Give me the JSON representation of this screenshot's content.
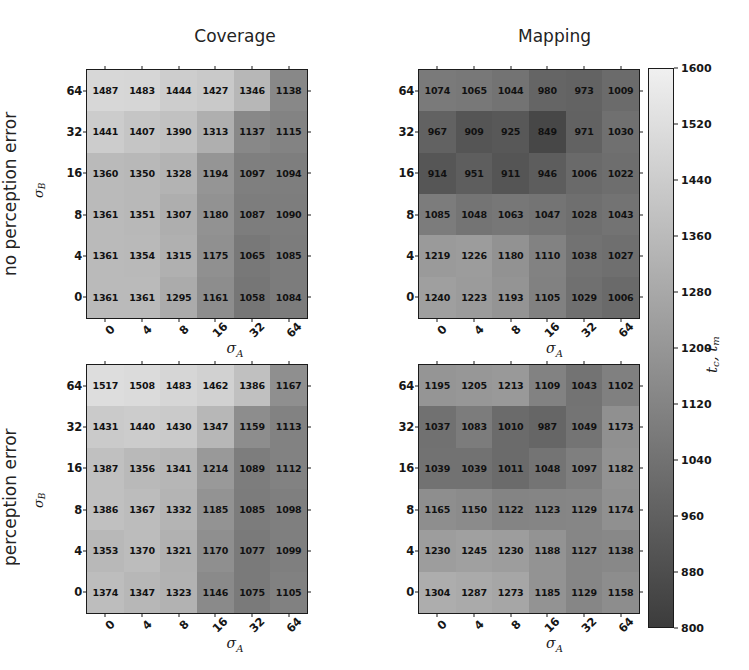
{
  "figure": {
    "column_titles": [
      "Coverage",
      "Mapping"
    ],
    "row_labels": [
      "no perception error",
      "perception error"
    ],
    "xlabel": "σ",
    "xlabel_sub": "A",
    "ylabel": "σ",
    "ylabel_sub": "B",
    "x_ticks": [
      "0",
      "4",
      "8",
      "16",
      "32",
      "64"
    ],
    "y_ticks": [
      "64",
      "32",
      "16",
      "8",
      "4",
      "0"
    ]
  },
  "colorbar": {
    "label": "t",
    "label_sub": "c",
    "label2": ", t",
    "label2_sub": "m",
    "label_full": "t_c, t_m",
    "vmin": 800,
    "vmax": 1600,
    "ticks": [
      "1600",
      "1520",
      "1440",
      "1360",
      "1280",
      "1200",
      "1120",
      "1040",
      "960",
      "880",
      "800"
    ],
    "tick_values": [
      1600,
      1520,
      1440,
      1360,
      1280,
      1200,
      1120,
      1040,
      960,
      880,
      800
    ],
    "colormap": "gray",
    "low_color": "#4a4a4a",
    "high_color": "#efefef"
  },
  "chart_data": {
    "type": "heatmap",
    "xlabel": "sigma_A",
    "ylabel": "sigma_B",
    "x_categories": [
      "0",
      "4",
      "8",
      "16",
      "32",
      "64"
    ],
    "y_categories": [
      "64",
      "32",
      "16",
      "8",
      "4",
      "0"
    ],
    "vmin": 800,
    "vmax": 1600,
    "colorbar_label": "t_c, t_m",
    "panels": [
      {
        "id": "coverage-no-perception-error",
        "column": "Coverage",
        "row": "no perception error",
        "values": [
          [
            1487,
            1483,
            1444,
            1427,
            1346,
            1138
          ],
          [
            1441,
            1407,
            1390,
            1313,
            1137,
            1115
          ],
          [
            1360,
            1350,
            1328,
            1194,
            1097,
            1094
          ],
          [
            1361,
            1351,
            1307,
            1180,
            1087,
            1090
          ],
          [
            1361,
            1354,
            1315,
            1175,
            1065,
            1085
          ],
          [
            1361,
            1361,
            1295,
            1161,
            1058,
            1084
          ]
        ]
      },
      {
        "id": "mapping-no-perception-error",
        "column": "Mapping",
        "row": "no perception error",
        "values": [
          [
            1074,
            1065,
            1044,
            980,
            973,
            1009
          ],
          [
            967,
            909,
            925,
            849,
            971,
            1030
          ],
          [
            914,
            951,
            911,
            946,
            1006,
            1022
          ],
          [
            1085,
            1048,
            1063,
            1047,
            1028,
            1043
          ],
          [
            1219,
            1226,
            1180,
            1110,
            1038,
            1027
          ],
          [
            1240,
            1223,
            1193,
            1105,
            1029,
            1006
          ]
        ]
      },
      {
        "id": "coverage-perception-error",
        "column": "Coverage",
        "row": "perception error",
        "values": [
          [
            1517,
            1508,
            1483,
            1462,
            1386,
            1167
          ],
          [
            1431,
            1440,
            1430,
            1347,
            1159,
            1113
          ],
          [
            1387,
            1356,
            1341,
            1214,
            1089,
            1112
          ],
          [
            1386,
            1367,
            1332,
            1185,
            1085,
            1098
          ],
          [
            1353,
            1370,
            1321,
            1170,
            1077,
            1099
          ],
          [
            1374,
            1347,
            1323,
            1146,
            1075,
            1105
          ]
        ]
      },
      {
        "id": "mapping-perception-error",
        "column": "Mapping",
        "row": "perception error",
        "values": [
          [
            1195,
            1205,
            1213,
            1109,
            1043,
            1102
          ],
          [
            1037,
            1083,
            1010,
            987,
            1049,
            1173
          ],
          [
            1039,
            1039,
            1011,
            1048,
            1097,
            1182
          ],
          [
            1165,
            1150,
            1122,
            1123,
            1129,
            1174
          ],
          [
            1230,
            1245,
            1230,
            1188,
            1127,
            1138
          ],
          [
            1304,
            1287,
            1273,
            1185,
            1129,
            1158
          ]
        ]
      }
    ]
  }
}
